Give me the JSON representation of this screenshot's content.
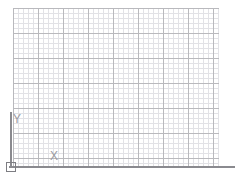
{
  "canvas": {
    "width": 235,
    "height": 181,
    "background_color": "#ffffff",
    "description": "CAD drawing canvas with graph-paper grid and coordinate axes"
  },
  "grid": {
    "minor_spacing_px": 5,
    "major_spacing_px": 25,
    "minor_color": "#e2e2e6",
    "major_color": "#b9b9bd",
    "left_px": 13,
    "top_px": 8,
    "width_px": 206,
    "height_px": 159,
    "minor_columns": 41,
    "minor_rows": 32,
    "major_columns": 8,
    "major_rows": 6
  },
  "axes": {
    "color": "#8a8a8f",
    "x": {
      "label": "X",
      "left_px": 9,
      "top_px": 166,
      "length_px": 226,
      "thickness_px": 2
    },
    "y": {
      "label": "Y",
      "left_px": 10,
      "top_px": 112,
      "length_px": 56,
      "thickness_px": 2
    }
  },
  "origin": {
    "marker_name": "ucs-origin-square",
    "left_px": 6,
    "top_px": 162,
    "size_px": 10,
    "border_color": "#7d7d82"
  },
  "labels": {
    "y_label": "Y",
    "x_label": "X",
    "color": "#9a9aa0",
    "font_size_px": 12
  }
}
